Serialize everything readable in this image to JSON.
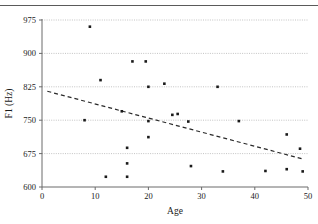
{
  "figure": {
    "running_head": "",
    "header_rule": true
  },
  "chart_data": {
    "type": "scatter",
    "title": "",
    "subtitle": "",
    "xlabel": "Age",
    "ylabel": "F1 (Hz)",
    "xlim": [
      0,
      50
    ],
    "ylim": [
      600,
      975
    ],
    "xticks": [
      0,
      10,
      20,
      30,
      40,
      50
    ],
    "xtick_labels": [
      "0",
      "10",
      "20",
      "30",
      "40",
      "50"
    ],
    "yticks": [
      600,
      675,
      750,
      825,
      900,
      975
    ],
    "ytick_labels": [
      "600",
      "675",
      "750",
      "825",
      "900",
      "975"
    ],
    "grid": {
      "horizontal": true,
      "vertical": false,
      "style": "dotted",
      "color": "#b4b4b4"
    },
    "legend": null,
    "marker": {
      "shape": "square",
      "color": "#1a1a1a",
      "size": 2.6
    },
    "points": [
      {
        "x": 9,
        "y": 960
      },
      {
        "x": 8,
        "y": 750
      },
      {
        "x": 11,
        "y": 840
      },
      {
        "x": 12,
        "y": 623
      },
      {
        "x": 15,
        "y": 770
      },
      {
        "x": 16,
        "y": 688
      },
      {
        "x": 16,
        "y": 653
      },
      {
        "x": 16,
        "y": 623
      },
      {
        "x": 17,
        "y": 882
      },
      {
        "x": 19.5,
        "y": 882
      },
      {
        "x": 20,
        "y": 825
      },
      {
        "x": 20,
        "y": 748
      },
      {
        "x": 20,
        "y": 712
      },
      {
        "x": 23,
        "y": 832
      },
      {
        "x": 24.5,
        "y": 762
      },
      {
        "x": 25.5,
        "y": 764
      },
      {
        "x": 27.5,
        "y": 747
      },
      {
        "x": 28,
        "y": 647
      },
      {
        "x": 33,
        "y": 825
      },
      {
        "x": 34,
        "y": 635
      },
      {
        "x": 37,
        "y": 748
      },
      {
        "x": 42,
        "y": 636
      },
      {
        "x": 46,
        "y": 718
      },
      {
        "x": 46,
        "y": 640
      },
      {
        "x": 48.5,
        "y": 686
      },
      {
        "x": 49,
        "y": 635
      }
    ],
    "trendline": {
      "type": "linear-fit",
      "style": "dashed",
      "color": "#2a2a2a",
      "x_start": 1,
      "y_start": 815,
      "x_end": 49,
      "y_end": 663
    },
    "axis_color": "#6a6a6a"
  }
}
